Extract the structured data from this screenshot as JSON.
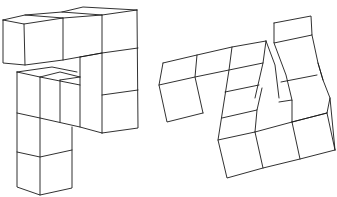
{
  "figure": {
    "type": "mental-rotation-cube-figures",
    "stroke_color": "#1a1a1a",
    "background": "#ffffff",
    "shapes": [
      {
        "name": "left-cube-assembly",
        "description": "Cube structure: horizontal bar of 3 cubes on top, right column of 3 cubes stacked down, inner step and a left column of 3 cubes going down",
        "polylines": [
          [
            [
              3,
              20
            ],
            [
              25,
              15
            ],
            [
              62,
              12
            ],
            [
              83,
              7
            ],
            [
              137,
              10
            ]
          ],
          [
            [
              3,
              20
            ],
            [
              24,
              24
            ],
            [
              63,
              18
            ],
            [
              102,
              15
            ],
            [
              137,
              10
            ]
          ],
          [
            [
              25,
              15
            ],
            [
              63,
              18
            ]
          ],
          [
            [
              62,
              12
            ],
            [
              102,
              15
            ]
          ],
          [
            [
              3,
              20
            ],
            [
              3,
              63
            ],
            [
              25,
              65
            ],
            [
              63,
              60
            ],
            [
              102,
              53
            ],
            [
              138,
              48
            ]
          ],
          [
            [
              24,
              24
            ],
            [
              25,
              65
            ]
          ],
          [
            [
              63,
              18
            ],
            [
              63,
              60
            ]
          ],
          [
            [
              102,
              15
            ],
            [
              102,
              133
            ]
          ],
          [
            [
              137,
              10
            ],
            [
              138,
              128
            ],
            [
              102,
              133
            ]
          ],
          [
            [
              102,
              95
            ],
            [
              138,
              90
            ]
          ],
          [
            [
              80,
              57
            ],
            [
              80,
              127
            ]
          ],
          [
            [
              80,
              57
            ],
            [
              102,
              53
            ]
          ],
          [
            [
              17,
              72
            ],
            [
              52,
              67
            ],
            [
              77,
              72
            ]
          ],
          [
            [
              17,
              72
            ],
            [
              40,
              77
            ],
            [
              80,
              85
            ]
          ],
          [
            [
              40,
              77
            ],
            [
              60,
              72
            ],
            [
              80,
              77
            ]
          ],
          [
            [
              60,
              80
            ],
            [
              80,
              77
            ]
          ],
          [
            [
              60,
              80
            ],
            [
              60,
              122
            ]
          ],
          [
            [
              17,
              72
            ],
            [
              17,
              187
            ],
            [
              40,
              195
            ],
            [
              72,
              188
            ],
            [
              72,
              127
            ]
          ],
          [
            [
              40,
              77
            ],
            [
              40,
              195
            ]
          ],
          [
            [
              17,
              113
            ],
            [
              40,
              118
            ],
            [
              80,
              127
            ],
            [
              102,
              133
            ]
          ],
          [
            [
              17,
              152
            ],
            [
              40,
              157
            ],
            [
              72,
              150
            ]
          ]
        ]
      },
      {
        "name": "right-cube-assembly",
        "description": "Rotated cube structure: left bar of 3 cubes, an inner step, a right tower of 3 cubes, and a base row of 3 cubes",
        "polylines": [
          [
            [
              163,
              63
            ],
            [
              197,
              55
            ],
            [
              232,
              47
            ],
            [
              266,
              41
            ]
          ],
          [
            [
              163,
              63
            ],
            [
              159,
              85
            ],
            [
              167,
              122
            ],
            [
              203,
              113
            ]
          ],
          [
            [
              159,
              85
            ],
            [
              195,
              77
            ],
            [
              229,
              70
            ],
            [
              263,
              63
            ]
          ],
          [
            [
              197,
              55
            ],
            [
              195,
              77
            ],
            [
              203,
              113
            ]
          ],
          [
            [
              232,
              47
            ],
            [
              229,
              70
            ],
            [
              218,
              140
            ],
            [
              227,
              178
            ],
            [
              263,
              168
            ],
            [
              300,
              159
            ],
            [
              335,
              150
            ]
          ],
          [
            [
              266,
              41
            ],
            [
              263,
              63
            ],
            [
              255,
              98
            ]
          ],
          [
            [
              266,
              41
            ],
            [
              275,
              65
            ],
            [
              279,
              98
            ]
          ],
          [
            [
              225,
              92
            ],
            [
              259,
              85
            ]
          ],
          [
            [
              222,
              118
            ],
            [
              257,
              110
            ],
            [
              262,
              88
            ]
          ],
          [
            [
              257,
              110
            ],
            [
              255,
              132
            ]
          ],
          [
            [
              218,
              140
            ],
            [
              255,
              132
            ],
            [
              292,
              122
            ],
            [
              327,
              113
            ]
          ],
          [
            [
              255,
              132
            ],
            [
              263,
              168
            ]
          ],
          [
            [
              292,
              122
            ],
            [
              300,
              159
            ]
          ],
          [
            [
              279,
              102
            ],
            [
              292,
              100
            ],
            [
              292,
              122
            ]
          ],
          [
            [
              274,
              23
            ],
            [
              311,
              16
            ],
            [
              312,
              35
            ],
            [
              274,
              43
            ],
            [
              274,
              23
            ]
          ],
          [
            [
              274,
              43
            ],
            [
              286,
              75
            ],
            [
              292,
              100
            ]
          ],
          [
            [
              312,
              35
            ],
            [
              318,
              63
            ],
            [
              323,
              80
            ],
            [
              330,
              98
            ],
            [
              335,
              150
            ]
          ],
          [
            [
              281,
              82
            ],
            [
              317,
              75
            ]
          ],
          [
            [
              318,
              63
            ],
            [
              323,
              80
            ]
          ],
          [
            [
              292,
              122
            ],
            [
              327,
              113
            ],
            [
              330,
              98
            ]
          ],
          [
            [
              327,
              113
            ],
            [
              335,
              150
            ]
          ]
        ]
      }
    ]
  }
}
